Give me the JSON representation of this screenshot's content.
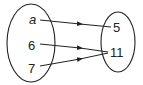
{
  "diagram": {
    "type": "mapping",
    "domain_set": {
      "name": "domain",
      "elements": [
        "a",
        "6",
        "7"
      ]
    },
    "range_set": {
      "name": "range",
      "elements": [
        "5",
        "11"
      ]
    },
    "mappings": [
      {
        "from": "a",
        "to": "5"
      },
      {
        "from": "6",
        "to": "11"
      },
      {
        "from": "7",
        "to": "11"
      }
    ],
    "colors": {
      "stroke": "#222222",
      "background": "#ffffff"
    }
  }
}
